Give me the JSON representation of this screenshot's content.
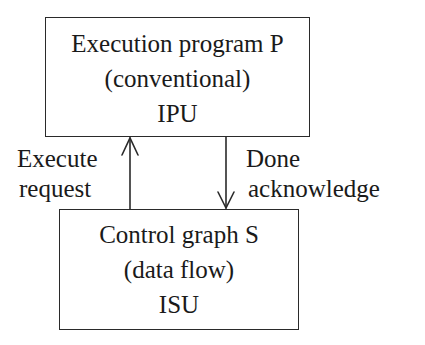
{
  "diagram": {
    "top_box": {
      "lines": [
        "Execution program P",
        "(conventional)",
        "IPU"
      ]
    },
    "bottom_box": {
      "lines": [
        "Control graph S",
        "(data flow)",
        "ISU"
      ]
    },
    "arrows": [
      {
        "id": "execute-request",
        "direction": "up",
        "from": "bottom_box",
        "to": "top_box",
        "label_lines": [
          "Execute",
          "request"
        ]
      },
      {
        "id": "done-acknowledge",
        "direction": "down",
        "from": "top_box",
        "to": "bottom_box",
        "label_lines": [
          "Done",
          "acknowledge"
        ]
      }
    ]
  }
}
